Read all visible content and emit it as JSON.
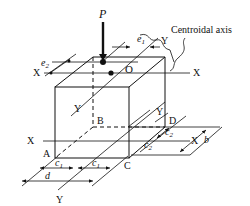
{
  "diagram": {
    "type": "isometric-column-eccentric-load",
    "load_label": "P",
    "centroid_label": "O",
    "callout": "Centroidal axis",
    "axis_labels": {
      "x_top_left": "X",
      "x_top_right": "X",
      "y_top": "Y",
      "y_mid_left": "Y",
      "y_mid_right": "Y",
      "x_base_left": "X",
      "x_base_right": "X",
      "y_base": "Y"
    },
    "corner_labels": {
      "a": "A",
      "b": "B",
      "c": "C",
      "d": "D"
    },
    "dimension_labels": {
      "e1": "e",
      "e1_sub": "1",
      "e2": "e",
      "e2_sub": "2",
      "c1_left": "c",
      "c1_left_sub": "1",
      "c1_right": "c",
      "c1_right_sub": "1",
      "c2_upper": "c",
      "c2_upper_sub": "2",
      "c2_lower": "c",
      "c2_lower_sub": "2",
      "d": "d",
      "b": "b"
    },
    "colors": {
      "ink": "#111111",
      "background": "#ffffff"
    }
  }
}
